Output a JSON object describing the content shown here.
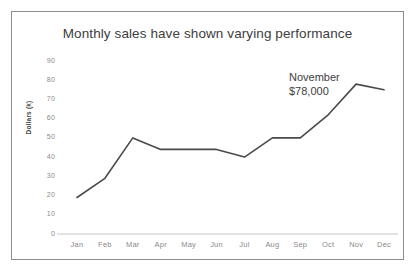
{
  "card": {
    "border_color": "#8c8c8c",
    "background": "#ffffff"
  },
  "chart_data": {
    "type": "line",
    "title": "Monthly sales have shown varying performance",
    "xlabel": "",
    "ylabel": "Dollars (k)",
    "categories": [
      "Jan",
      "Feb",
      "Mar",
      "Apr",
      "May",
      "Jun",
      "Jul",
      "Aug",
      "Sep",
      "Oct",
      "Nov",
      "Dec"
    ],
    "values": [
      19,
      29,
      50,
      44,
      44,
      44,
      40,
      50,
      50,
      62,
      78,
      75
    ],
    "series": [
      {
        "name": "Monthly sales",
        "values": [
          19,
          29,
          50,
          44,
          44,
          44,
          40,
          50,
          50,
          62,
          78,
          75
        ]
      }
    ],
    "ylim": [
      0,
      90
    ],
    "yticks": [
      0,
      10,
      20,
      30,
      40,
      50,
      60,
      70,
      80,
      90
    ],
    "ytick_labels": [
      "0",
      "10",
      "20",
      "30",
      "40",
      "50",
      "60",
      "70",
      "80",
      "90"
    ],
    "grid": false,
    "legend": false,
    "line_color": "#4a4a4a",
    "axis_color": "#c8c8c8",
    "annotations": [
      {
        "name": "november-callout",
        "line1": "November",
        "line2": "$78,000",
        "points_to_category": "Nov",
        "points_to_value": 78
      }
    ]
  }
}
